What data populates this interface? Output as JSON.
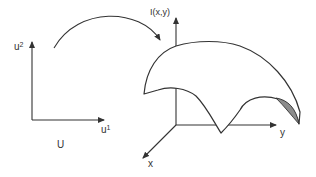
{
  "diagram": {
    "parameter_space": {
      "name": "U",
      "axis_vertical": {
        "base": "u",
        "superscript": "2"
      },
      "axis_horizontal": {
        "base": "u",
        "superscript": "1"
      }
    },
    "mapping_arrow": {
      "direction": "U to surface"
    },
    "image_space": {
      "vertical_axis_label": "I(x,y)",
      "y_axis_label": "y",
      "x_axis_label": "x"
    },
    "surface": {
      "shaded_region": "underside fold near y-axis end"
    },
    "colors": {
      "line": "#333333",
      "shade": "#8c8c8c",
      "background": "#ffffff"
    }
  }
}
